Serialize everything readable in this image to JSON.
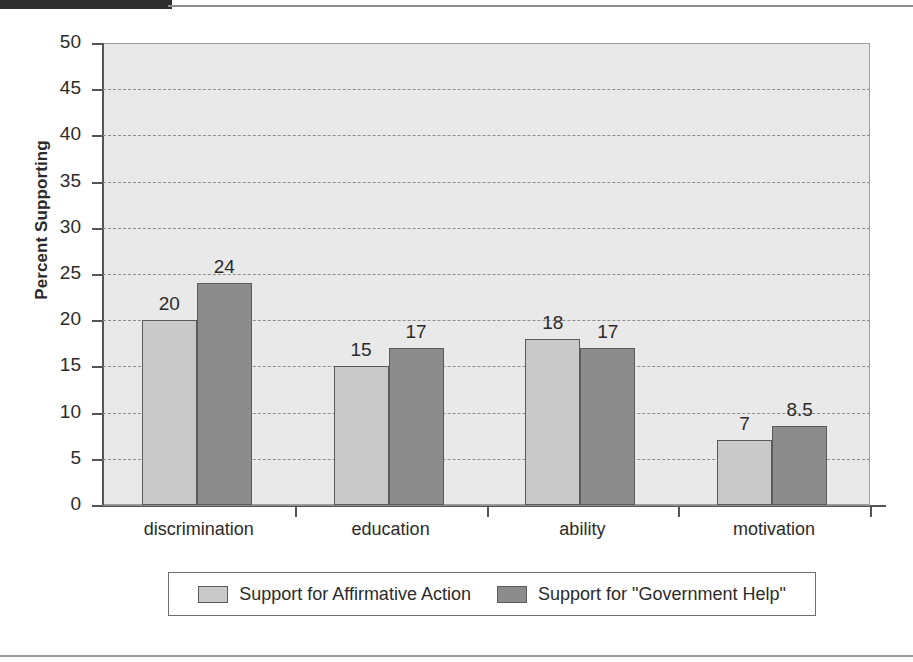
{
  "chart_data": {
    "type": "bar",
    "title": "",
    "xlabel": "",
    "ylabel": "Percent Supporting",
    "ylim": [
      0,
      50
    ],
    "ytick_step": 5,
    "yticks": [
      50,
      45,
      40,
      35,
      30,
      25,
      20,
      15,
      10,
      5,
      0
    ],
    "grid": true,
    "grid_style": "dashed-horizontal",
    "legend_position": "bottom-outside-boxed",
    "categories": [
      "discrimination",
      "education",
      "ability",
      "motivation"
    ],
    "series": [
      {
        "name": "Support for Affirmative Action",
        "color": "#c9c9c9",
        "values": [
          20,
          15,
          18,
          7
        ],
        "value_labels": [
          "20",
          "15",
          "18",
          "7"
        ]
      },
      {
        "name": "Support for \"Government Help\"",
        "color": "#8c8c8c",
        "values": [
          24,
          17,
          17,
          8.5
        ],
        "value_labels": [
          "24",
          "17",
          "17",
          "8.5"
        ]
      }
    ]
  },
  "colors": {
    "plot_background": "#e9e9e9",
    "axis": "#555555",
    "gridline": "#8e8e8e",
    "series_light": "#c9c9c9",
    "series_dark": "#8c8c8c",
    "page_background": "#ffffff",
    "top_bar": "#2e2e2e"
  }
}
